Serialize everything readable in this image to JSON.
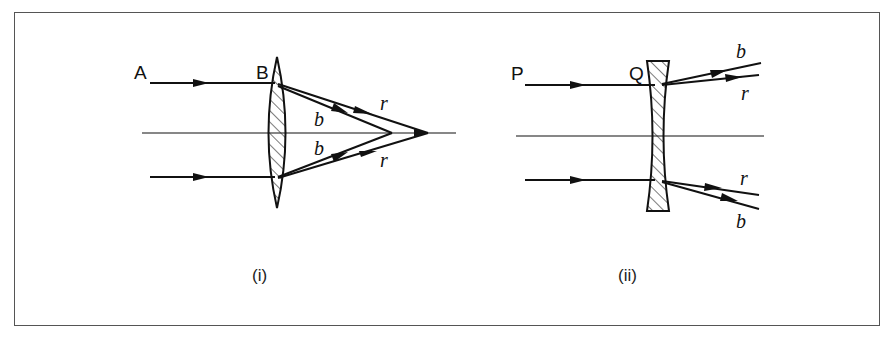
{
  "figure": {
    "panels": [
      {
        "id": "i",
        "caption": "(i)",
        "lens_type": "converging (convex) lens",
        "labels": {
          "ray_start": "A",
          "lens_point": "B",
          "blue_upper": "b",
          "blue_lower": "b",
          "red_upper": "r",
          "red_lower": "r"
        }
      },
      {
        "id": "ii",
        "caption": "(ii)",
        "lens_type": "diverging (concave) lens",
        "labels": {
          "ray_start": "P",
          "lens_point": "Q",
          "blue_upper": "b",
          "red_upper": "r",
          "red_lower": "r",
          "blue_lower": "b"
        }
      }
    ],
    "colors": {
      "line": "#111111",
      "frame": "#555555",
      "background": "#ffffff"
    }
  }
}
